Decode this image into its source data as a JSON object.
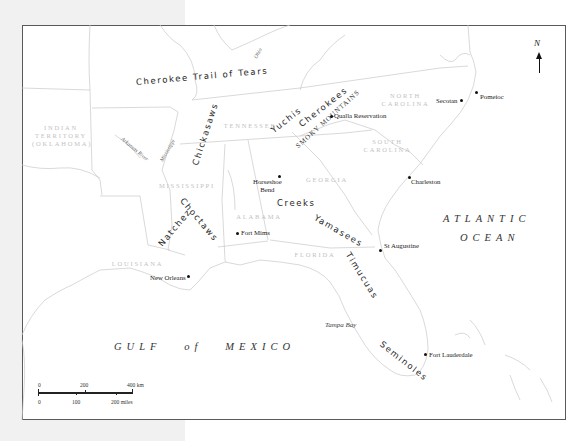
{
  "map": {
    "title": "Southeastern North America — Native peoples",
    "north_label": "N",
    "water_bodies": [
      {
        "id": "atlantic-1",
        "text": "ATLANTIC",
        "x": 443,
        "y": 213
      },
      {
        "id": "atlantic-2",
        "text": "OCEAN",
        "x": 460,
        "y": 232
      },
      {
        "id": "gulf",
        "text": "GULF   of   MEXICO",
        "x": 114,
        "y": 341
      },
      {
        "id": "tampa",
        "text": "Tampa Bay",
        "x": 325,
        "y": 321
      }
    ],
    "tribes": [
      {
        "id": "cherokee-trail",
        "text": "Cherokee Trail of Tears",
        "x": 136,
        "y": 77,
        "rot": -5
      },
      {
        "id": "chickasaws",
        "text": "Chickasaws",
        "x": 195,
        "y": 160,
        "rot": -72
      },
      {
        "id": "yuchis",
        "text": "Yuchis",
        "x": 272,
        "y": 126,
        "rot": -38
      },
      {
        "id": "cherokees",
        "text": "Cherokees",
        "x": 300,
        "y": 120,
        "rot": -38
      },
      {
        "id": "choctaws",
        "text": "Choctaws",
        "x": 182,
        "y": 194,
        "rot": 50
      },
      {
        "id": "natchez",
        "text": "Natchez",
        "x": 160,
        "y": 240,
        "rot": -50
      },
      {
        "id": "creeks",
        "text": "Creeks",
        "x": 277,
        "y": 198,
        "rot": 0
      },
      {
        "id": "yamasees",
        "text": "Yamasees",
        "x": 315,
        "y": 212,
        "rot": 30
      },
      {
        "id": "timucuas",
        "text": "Timucuas",
        "x": 348,
        "y": 248,
        "rot": 58
      },
      {
        "id": "seminoles",
        "text": "Seminoles",
        "x": 381,
        "y": 338,
        "rot": 38
      }
    ],
    "mountains": {
      "text": "SMOKY MOUNTAINS",
      "x": 297,
      "y": 143,
      "rot": -42
    },
    "states": [
      {
        "id": "indian-territory",
        "text": "INDIAN\nTERRITORY\n(OKLAHOMA)",
        "x": 32,
        "y": 124,
        "w": 58
      },
      {
        "id": "tennessee",
        "text": "TENNESSEE",
        "x": 220,
        "y": 122,
        "w": 60
      },
      {
        "id": "north-carolina",
        "text": "NORTH\nCAROLINA",
        "x": 378,
        "y": 92,
        "w": 55
      },
      {
        "id": "south-carolina",
        "text": "SOUTH\nCAROLINA",
        "x": 360,
        "y": 138,
        "w": 55
      },
      {
        "id": "georgia",
        "text": "GEORGIA",
        "x": 302,
        "y": 176,
        "w": 50
      },
      {
        "id": "mississippi",
        "text": "MISSISSIPPI",
        "x": 158,
        "y": 182,
        "w": 58
      },
      {
        "id": "alabama",
        "text": "ALABAMA",
        "x": 234,
        "y": 213,
        "w": 50
      },
      {
        "id": "louisiana",
        "text": "LOUISIANA",
        "x": 110,
        "y": 260,
        "w": 55
      },
      {
        "id": "florida",
        "text": "FLORIDA",
        "x": 290,
        "y": 251,
        "w": 50
      }
    ],
    "rivers": [
      {
        "id": "ohio",
        "text": "Ohio",
        "x": 255,
        "y": 55,
        "rot": -60
      },
      {
        "id": "arkansas",
        "text": "Arkansas River",
        "x": 122,
        "y": 135,
        "rot": 40
      },
      {
        "id": "mississippi-river",
        "text": "Mississippi",
        "x": 161,
        "y": 158,
        "rot": -60
      }
    ],
    "cities": [
      {
        "id": "qualla",
        "text": "Qualla Reservation",
        "dot": [
          331,
          116
        ],
        "x": 334,
        "y": 112
      },
      {
        "id": "secotan",
        "text": "Secotan",
        "dot": [
          461,
          100
        ],
        "x": 436,
        "y": 97
      },
      {
        "id": "pomeioc",
        "text": "Pomeioc",
        "dot": [
          476,
          92
        ],
        "x": 480,
        "y": 93
      },
      {
        "id": "charleston",
        "text": "Charleston",
        "dot": [
          409,
          177
        ],
        "x": 411,
        "y": 178
      },
      {
        "id": "horseshoe",
        "text": "Horseshoe\nBend",
        "dot": [
          279,
          176
        ],
        "x": 253,
        "y": 178
      },
      {
        "id": "fort-mims",
        "text": "Fort Mims",
        "dot": [
          237,
          233
        ],
        "x": 241,
        "y": 229
      },
      {
        "id": "new-orleans",
        "text": "New Orleans",
        "dot": [
          188,
          276
        ],
        "x": 150,
        "y": 274
      },
      {
        "id": "st-augustine",
        "text": "St Augustine",
        "dot": [
          380,
          250
        ],
        "x": 384,
        "y": 242
      },
      {
        "id": "fort-lauderdale",
        "text": "Fort Lauderdale",
        "dot": [
          425,
          354
        ],
        "x": 429,
        "y": 351
      }
    ],
    "scale_bar": {
      "km_labels": [
        "0",
        "200",
        "400 km"
      ],
      "mile_labels": [
        "0",
        "100",
        "200 miles"
      ]
    }
  }
}
